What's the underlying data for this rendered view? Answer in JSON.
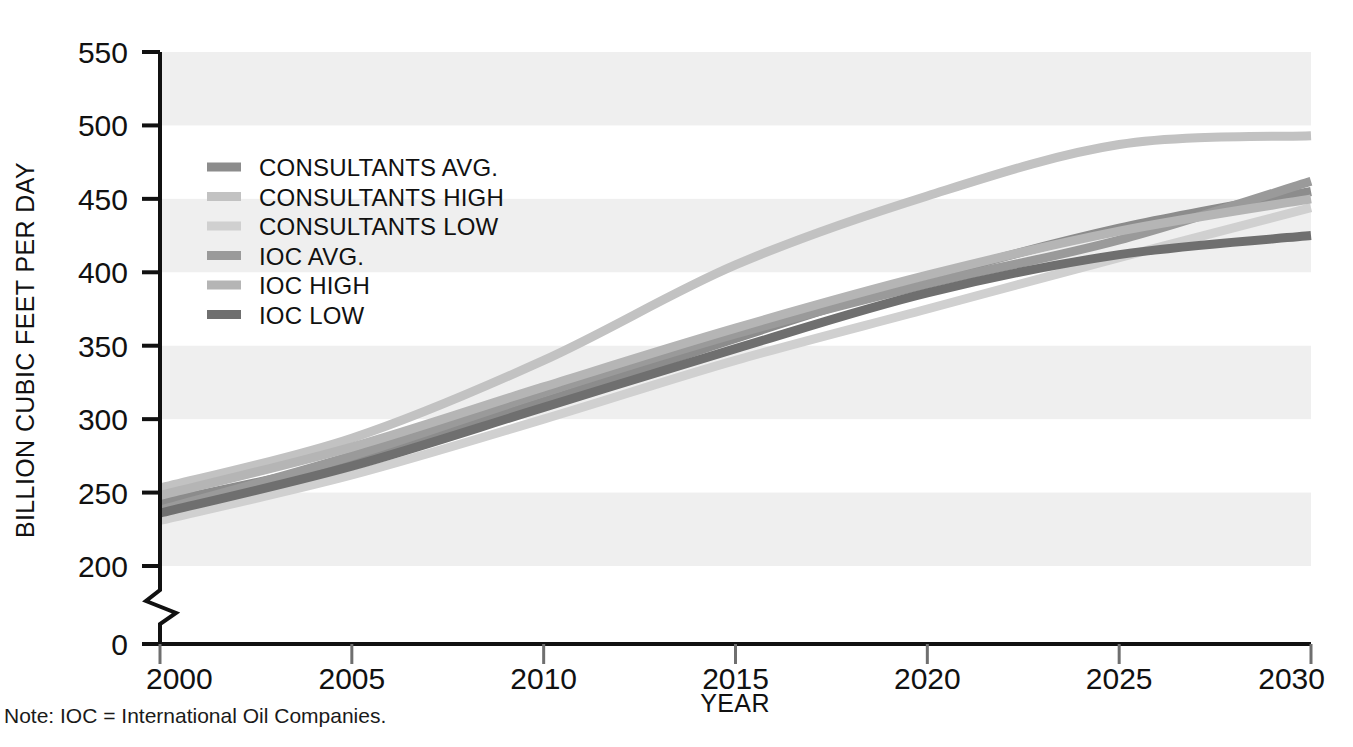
{
  "chart_data": {
    "type": "line",
    "title": "",
    "xlabel": "YEAR",
    "ylabel": "BILLION CUBIC FEET PER DAY",
    "xlim": [
      2000,
      2030
    ],
    "ylim": [
      200,
      550
    ],
    "y_axis_break": true,
    "y_break_values": [
      0,
      200
    ],
    "xticks": [
      2000,
      2005,
      2010,
      2015,
      2020,
      2025,
      2030
    ],
    "yticks": [
      0,
      200,
      250,
      300,
      350,
      400,
      450,
      500,
      550
    ],
    "grid": false,
    "banded_background": true,
    "band_ranges": [
      [
        500,
        550
      ],
      [
        400,
        450
      ],
      [
        300,
        350
      ],
      [
        200,
        250
      ]
    ],
    "band_color": "#efefef",
    "legend_position": "upper-left-inside",
    "x": [
      2000,
      2005,
      2010,
      2015,
      2020,
      2025,
      2030
    ],
    "series": [
      {
        "name": "CONSULTANTS AVG.",
        "color": "#8c8c8c",
        "values": [
          243,
          272,
          312,
          355,
          396,
          430,
          455
        ]
      },
      {
        "name": "CONSULTANTS HIGH",
        "color": "#c2c2c2",
        "values": [
          253,
          287,
          340,
          405,
          452,
          487,
          493
        ]
      },
      {
        "name": "CONSULTANTS LOW",
        "color": "#d0d0d0",
        "values": [
          231,
          262,
          300,
          340,
          375,
          410,
          444
        ]
      },
      {
        "name": "IOC AVG.",
        "color": "#9a9a9a",
        "values": [
          238,
          275,
          318,
          358,
          392,
          422,
          462
        ]
      },
      {
        "name": "IOC HIGH",
        "color": "#b5b5b5",
        "values": [
          248,
          281,
          322,
          362,
          398,
          428,
          450
        ]
      },
      {
        "name": "IOC LOW",
        "color": "#6f6f6f",
        "values": [
          236,
          268,
          308,
          348,
          386,
          412,
          425
        ]
      }
    ]
  },
  "legend": {
    "entries": [
      {
        "label": "CONSULTANTS AVG.",
        "color": "#8c8c8c"
      },
      {
        "label": "CONSULTANTS HIGH",
        "color": "#c2c2c2"
      },
      {
        "label": "CONSULTANTS LOW",
        "color": "#d0d0d0"
      },
      {
        "label": "IOC AVG.",
        "color": "#9a9a9a"
      },
      {
        "label": "IOC HIGH",
        "color": "#b5b5b5"
      },
      {
        "label": "IOC LOW",
        "color": "#6f6f6f"
      }
    ]
  },
  "axes": {
    "y_title": "BILLION CUBIC FEET PER DAY",
    "x_title": "YEAR",
    "y_tick_labels": [
      "550",
      "500",
      "450",
      "400",
      "350",
      "300",
      "250",
      "200",
      "0"
    ],
    "x_tick_labels": [
      "2000",
      "2005",
      "2010",
      "2015",
      "2020",
      "2025",
      "2030"
    ]
  },
  "note": {
    "text": "Note: IOC = International Oil Companies."
  },
  "colors": {
    "axis": "#111111",
    "band": "#efefef",
    "background": "#ffffff"
  }
}
